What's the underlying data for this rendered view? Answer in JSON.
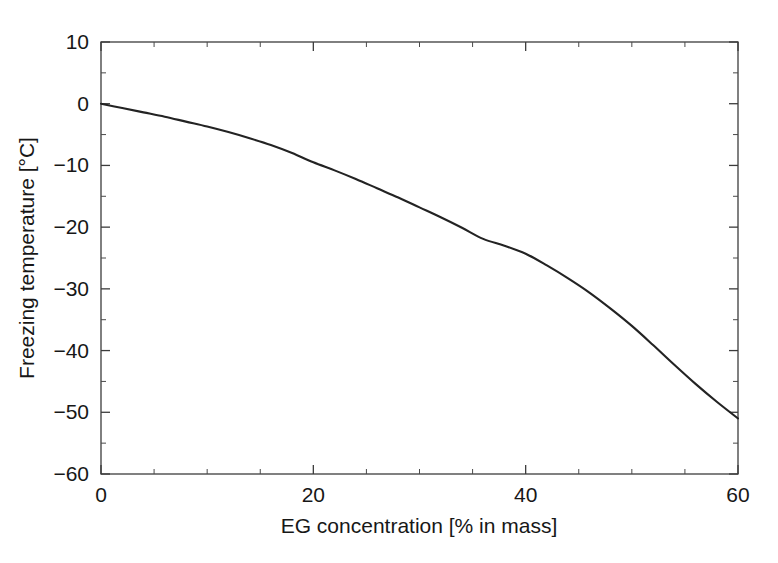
{
  "chart_data": {
    "type": "line",
    "title": "",
    "xlabel": "EG concentration [% in mass]",
    "ylabel": "Freezing temperature [°C]",
    "xlim": [
      0,
      60
    ],
    "ylim": [
      -60,
      10
    ],
    "grid": false,
    "legend": null,
    "x_ticks": [
      0,
      20,
      40,
      60
    ],
    "x_tick_labels": [
      "0",
      "20",
      "40",
      "60"
    ],
    "x_minor_step": 5,
    "y_ticks": [
      10,
      0,
      -10,
      -20,
      -30,
      -40,
      -50,
      -60
    ],
    "y_tick_labels": [
      "10",
      "0",
      "−10",
      "−20",
      "−30",
      "−40",
      "−50",
      "−60"
    ],
    "y_minor_step": 5,
    "series": [
      {
        "name": "Freezing temperature of EG/water mixture",
        "color": "#232323",
        "x": [
          0,
          2,
          4,
          6,
          8,
          10,
          12,
          14,
          16,
          18,
          20,
          22,
          24,
          26,
          28,
          30,
          32,
          34,
          36,
          38,
          40,
          42,
          44,
          46,
          48,
          50,
          52,
          54,
          56,
          58,
          60
        ],
        "values": [
          0.0,
          -0.7,
          -1.4,
          -2.1,
          -2.9,
          -3.7,
          -4.6,
          -5.6,
          -6.7,
          -8.0,
          -9.5,
          -10.8,
          -12.2,
          -13.7,
          -15.2,
          -16.8,
          -18.4,
          -20.1,
          -21.9,
          -23.0,
          -24.3,
          -26.2,
          -28.3,
          -30.6,
          -33.2,
          -36.0,
          -39.1,
          -42.3,
          -45.4,
          -48.3,
          -51.0
        ]
      }
    ],
    "axis_box": {
      "left": 101,
      "right": 738,
      "top": 42,
      "bottom": 474
    }
  },
  "figure": {
    "background_color": "#ffffff",
    "axis_color": "#3c3c3c"
  }
}
